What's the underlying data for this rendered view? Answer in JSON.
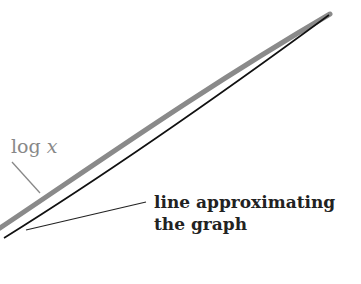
{
  "labels": {
    "curve_label_prefix": "log",
    "curve_label_var": "x",
    "approx_line1": "line approximating",
    "approx_line2": "the graph"
  },
  "colors": {
    "curve": "#8a8a8a",
    "line": "#111111",
    "text": "#222222",
    "curve_label": "#888888"
  }
}
